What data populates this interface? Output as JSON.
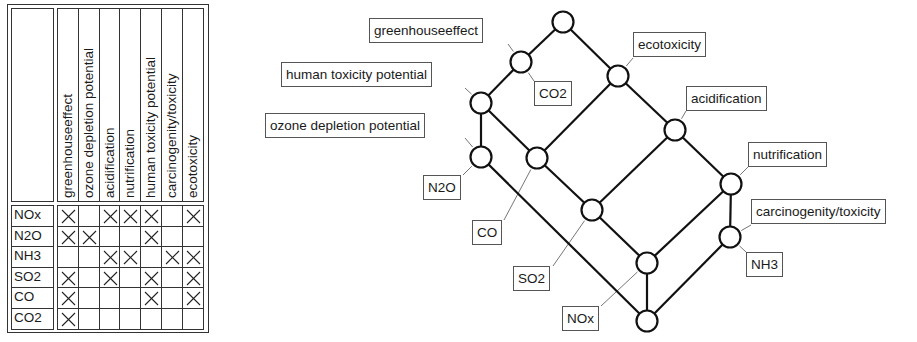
{
  "matrix": {
    "columns": [
      "greenhouseeffect",
      "ozone depletion potential",
      "acidification",
      "nutrification",
      "human toxicity potential",
      "carcinogenity/toxicity",
      "ecotoxicity"
    ],
    "rows": [
      {
        "label": "NOx",
        "marks": [
          1,
          0,
          1,
          1,
          1,
          0,
          1
        ]
      },
      {
        "label": "N2O",
        "marks": [
          1,
          1,
          0,
          0,
          1,
          0,
          0
        ]
      },
      {
        "label": "NH3",
        "marks": [
          0,
          0,
          1,
          1,
          0,
          1,
          1
        ]
      },
      {
        "label": "SO2",
        "marks": [
          1,
          0,
          1,
          0,
          1,
          0,
          1
        ]
      },
      {
        "label": "CO",
        "marks": [
          1,
          0,
          0,
          0,
          1,
          0,
          1
        ]
      },
      {
        "label": "CO2",
        "marks": [
          1,
          0,
          0,
          0,
          0,
          0,
          0
        ]
      }
    ],
    "mark_symbol": "cross"
  },
  "lattice": {
    "nodes": [
      {
        "id": "top",
        "x": 563,
        "y": 22
      },
      {
        "id": "greenhouse",
        "x": 521,
        "y": 62
      },
      {
        "id": "humantox",
        "x": 481,
        "y": 103
      },
      {
        "id": "ecotox",
        "x": 618,
        "y": 76
      },
      {
        "id": "ozone",
        "x": 481,
        "y": 157
      },
      {
        "id": "co",
        "x": 537,
        "y": 158
      },
      {
        "id": "acid",
        "x": 675,
        "y": 130
      },
      {
        "id": "so2",
        "x": 592,
        "y": 210
      },
      {
        "id": "nutri",
        "x": 731,
        "y": 184
      },
      {
        "id": "nox",
        "x": 647,
        "y": 263
      },
      {
        "id": "nh3",
        "x": 730,
        "y": 237
      },
      {
        "id": "bottom",
        "x": 647,
        "y": 321
      }
    ],
    "edges": [
      [
        "top",
        "greenhouse"
      ],
      [
        "top",
        "ecotox"
      ],
      [
        "greenhouse",
        "humantox"
      ],
      [
        "humantox",
        "ozone"
      ],
      [
        "humantox",
        "co"
      ],
      [
        "ecotox",
        "co"
      ],
      [
        "ecotox",
        "acid"
      ],
      [
        "acid",
        "so2"
      ],
      [
        "acid",
        "nutri"
      ],
      [
        "ozone",
        "bottom"
      ],
      [
        "co",
        "so2"
      ],
      [
        "so2",
        "nox"
      ],
      [
        "nutri",
        "nox"
      ],
      [
        "nutri",
        "nh3"
      ],
      [
        "nox",
        "bottom"
      ],
      [
        "nh3",
        "bottom"
      ]
    ],
    "labels": [
      {
        "text": "greenhouseeffect",
        "x": 369,
        "y": 18,
        "lx": 508,
        "ly": 44,
        "node": "greenhouse"
      },
      {
        "text": "human toxicity potential",
        "x": 281,
        "y": 62,
        "lx": 465,
        "ly": 88,
        "node": "humantox"
      },
      {
        "text": "ozone depletion potential",
        "x": 265,
        "y": 113,
        "lx": 465,
        "ly": 138,
        "node": "ozone"
      },
      {
        "text": "ecotoxicity",
        "x": 633,
        "y": 32,
        "lx": 633,
        "ly": 58,
        "node": "ecotox"
      },
      {
        "text": "acidification",
        "x": 686,
        "y": 86,
        "lx": 686,
        "ly": 111,
        "node": "acid"
      },
      {
        "text": "nutrification",
        "x": 748,
        "y": 142,
        "lx": 748,
        "ly": 167,
        "node": "nutri"
      },
      {
        "text": "carcinogenity/toxicity",
        "x": 751,
        "y": 199,
        "lx": 751,
        "ly": 225,
        "node": "nh3"
      },
      {
        "text": "CO2",
        "x": 534,
        "y": 81,
        "lx": 534,
        "ly": 81,
        "node": "greenhouse"
      },
      {
        "text": "N2O",
        "x": 423,
        "y": 175,
        "lx": 463,
        "ly": 175,
        "node": "ozone"
      },
      {
        "text": "CO",
        "x": 472,
        "y": 220,
        "lx": 504,
        "ly": 220,
        "node": "co"
      },
      {
        "text": "SO2",
        "x": 513,
        "y": 266,
        "lx": 553,
        "ly": 266,
        "node": "so2"
      },
      {
        "text": "NOx",
        "x": 562,
        "y": 306,
        "lx": 601,
        "ly": 306,
        "node": "nox"
      },
      {
        "text": "NH3",
        "x": 746,
        "y": 252,
        "lx": 746,
        "ly": 252,
        "node": "nh3"
      }
    ]
  }
}
